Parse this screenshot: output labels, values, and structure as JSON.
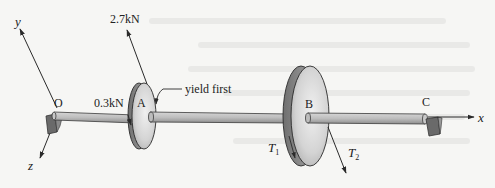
{
  "diagram": {
    "type": "mechanics-shaft-with-pulleys",
    "axes": {
      "x_label": "x",
      "y_label": "y",
      "z_label": "z"
    },
    "points": {
      "O": "O",
      "A": "A",
      "B": "B",
      "C": "C"
    },
    "loads": {
      "force_up": "2.7kN",
      "force_small": "0.3kN",
      "tension_1": "T",
      "tension_1_sub": "1",
      "tension_2": "T",
      "tension_2_sub": "2"
    },
    "annotation": "yield first",
    "colors": {
      "background": "#f6f6f4",
      "shaft": "#b8b8b8",
      "shaft_outline": "#3a3a3a",
      "disk_face": "#dcdcdc",
      "disk_rim": "#9a9a9a",
      "support": "#6a6a6a",
      "line": "#2a2a2a"
    }
  }
}
